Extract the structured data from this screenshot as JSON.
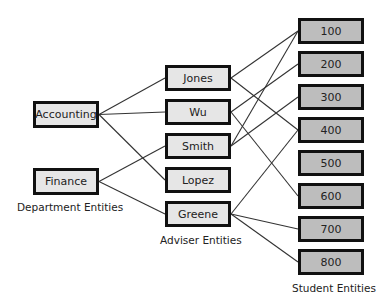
{
  "departments": {
    "label": "Department Entities",
    "items": [
      {
        "name": "Accounting",
        "x": 33,
        "y": 101,
        "w": 66,
        "h": 27
      },
      {
        "name": "Finance",
        "x": 33,
        "y": 168,
        "w": 66,
        "h": 27
      }
    ]
  },
  "advisers": {
    "label": "Adviser Entities",
    "items": [
      {
        "name": "Jones",
        "x": 165,
        "y": 65,
        "w": 66,
        "h": 26
      },
      {
        "name": "Wu",
        "x": 165,
        "y": 99,
        "w": 66,
        "h": 26
      },
      {
        "name": "Smith",
        "x": 165,
        "y": 133,
        "w": 66,
        "h": 26
      },
      {
        "name": "Lopez",
        "x": 165,
        "y": 167,
        "w": 66,
        "h": 26
      },
      {
        "name": "Greene",
        "x": 165,
        "y": 201,
        "w": 66,
        "h": 26
      }
    ]
  },
  "students": {
    "label": "Student Entities",
    "items": [
      {
        "name": "100",
        "x": 298,
        "y": 18,
        "w": 66,
        "h": 26
      },
      {
        "name": "200",
        "x": 298,
        "y": 51,
        "w": 66,
        "h": 26
      },
      {
        "name": "300",
        "x": 298,
        "y": 84,
        "w": 66,
        "h": 26
      },
      {
        "name": "400",
        "x": 298,
        "y": 117,
        "w": 66,
        "h": 26
      },
      {
        "name": "500",
        "x": 298,
        "y": 150,
        "w": 66,
        "h": 26
      },
      {
        "name": "600",
        "x": 298,
        "y": 183,
        "w": 66,
        "h": 26
      },
      {
        "name": "700",
        "x": 298,
        "y": 216,
        "w": 66,
        "h": 26
      },
      {
        "name": "800",
        "x": 298,
        "y": 249,
        "w": 66,
        "h": 26
      }
    ]
  },
  "links": {
    "department_to_adviser": [
      [
        "Accounting",
        "Jones"
      ],
      [
        "Accounting",
        "Wu"
      ],
      [
        "Accounting",
        "Lopez"
      ],
      [
        "Finance",
        "Smith"
      ],
      [
        "Finance",
        "Greene"
      ]
    ],
    "adviser_to_student": [
      [
        "Jones",
        "100"
      ],
      [
        "Jones",
        "400"
      ],
      [
        "Wu",
        "200"
      ],
      [
        "Wu",
        "600"
      ],
      [
        "Smith",
        "100"
      ],
      [
        "Smith",
        "300"
      ],
      [
        "Greene",
        "400"
      ],
      [
        "Greene",
        "700"
      ],
      [
        "Greene",
        "800"
      ]
    ]
  },
  "colors": {
    "border": "#111111",
    "department_fill": "#e6e6e6",
    "adviser_fill": "#e6e6e6",
    "student_fill": "#bdbdbd",
    "line": "#333333"
  }
}
